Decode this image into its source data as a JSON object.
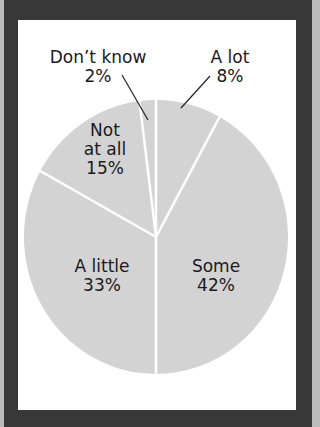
{
  "chart_data": {
    "type": "pie",
    "title": "",
    "start_angle": "12 o'clock, clockwise",
    "slices": [
      {
        "label": "A lot",
        "value": 8,
        "display": "8%"
      },
      {
        "label": "Some",
        "value": 42,
        "display": "42%"
      },
      {
        "label": "A little",
        "value": 33,
        "display": "33%"
      },
      {
        "label": "Not at all",
        "value": 15,
        "display": "15%"
      },
      {
        "label": "Don’t know",
        "value": 2,
        "display": "2%"
      }
    ],
    "colors": {
      "slice": "#d3d3d3",
      "separator": "#ffffff",
      "frame": "#383838",
      "background": "#ffffff"
    }
  },
  "labels": {
    "a_lot": {
      "name": "A lot",
      "pct": "8%"
    },
    "some": {
      "name": "Some",
      "pct": "42%"
    },
    "a_little": {
      "name": "A little",
      "pct": "33%"
    },
    "not_at_all": {
      "line1": "Not",
      "line2": "at all",
      "pct": "15%"
    },
    "dont_know": {
      "name": "Don’t know",
      "pct": "2%"
    }
  }
}
